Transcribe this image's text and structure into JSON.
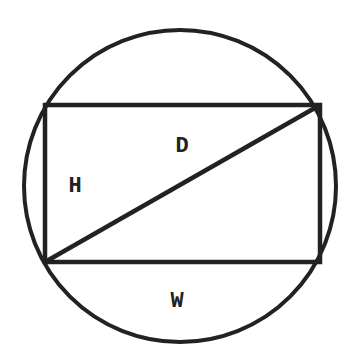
{
  "diagram": {
    "stroke_color": "#222222",
    "background": "#ffffff",
    "labels": {
      "height": "H",
      "width": "W",
      "diagonal": "D"
    },
    "shapes": {
      "circle": {
        "cx": 180,
        "cy": 186,
        "r": 157
      },
      "rectangle": {
        "x": 45,
        "y": 105,
        "width": 275,
        "height": 157
      },
      "diagonal": {
        "x1": 45,
        "y1": 262,
        "x2": 320,
        "y2": 105
      }
    }
  }
}
